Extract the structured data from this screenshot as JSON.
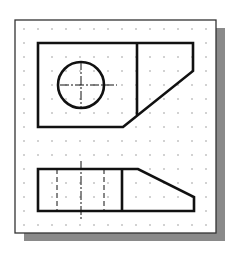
{
  "drawing": {
    "title": "Orthographic views with grid",
    "colors": {
      "background": "#ffffff",
      "paper": "#ffffff",
      "shadow": "#8a8a8a",
      "frame": "#333333",
      "lines": "#111111",
      "grid_dot": "#9a9a9a"
    },
    "frame": {
      "x": 15,
      "y": 20,
      "w": 201,
      "h": 213
    },
    "shadow": {
      "dx": 9,
      "dy": 8
    },
    "grid": {
      "x0": 24,
      "y0": 29,
      "spacing": 14,
      "cols": 14,
      "rows": 15
    },
    "top_view": {
      "outline": [
        [
          38,
          43
        ],
        [
          193,
          43
        ],
        [
          193,
          71
        ],
        [
          123,
          127
        ],
        [
          38,
          127
        ]
      ],
      "divider": [
        [
          137,
          43
        ],
        [
          137,
          115
        ]
      ],
      "circle": {
        "cx": 81,
        "cy": 85,
        "r": 23
      },
      "centerline_h": [
        [
          60,
          85
        ],
        [
          117,
          85
        ]
      ],
      "centerline_v": [
        [
          81,
          61
        ],
        [
          81,
          109
        ]
      ]
    },
    "front_view": {
      "outline": [
        [
          38,
          169
        ],
        [
          138,
          169
        ],
        [
          194,
          197
        ],
        [
          194,
          211
        ],
        [
          38,
          211
        ]
      ],
      "divider": [
        [
          122,
          169
        ],
        [
          122,
          211
        ]
      ],
      "hidden_lines": [
        [
          [
            57,
            169
          ],
          [
            57,
            211
          ]
        ],
        [
          [
            104,
            169
          ],
          [
            104,
            211
          ]
        ]
      ],
      "centerline_v": [
        [
          81,
          161
        ],
        [
          81,
          219
        ]
      ]
    }
  }
}
